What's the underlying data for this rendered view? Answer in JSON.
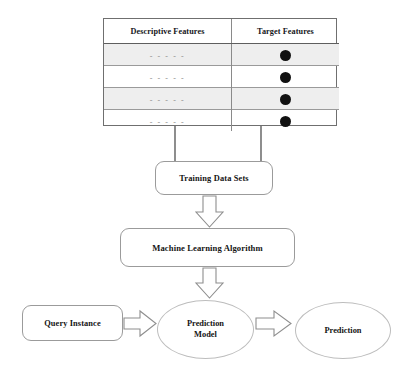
{
  "diagram": {
    "background_color": "#ffffff",
    "line_color": "#9b9b9b",
    "text_color": "#141414",
    "dot_color": "#111111",
    "shaded_row_color": "#eeeeee"
  },
  "table": {
    "name": "training-data-table",
    "columns": [
      {
        "key": "descriptive",
        "header": "Descriptive Features"
      },
      {
        "key": "target",
        "header": "Target Features"
      }
    ],
    "rows": [
      {
        "descriptive": "- - - - -",
        "target": "filled-circle",
        "shaded": true
      },
      {
        "descriptive": "- - - - -",
        "target": "filled-circle",
        "shaded": false
      },
      {
        "descriptive": "- - - - -",
        "target": "filled-circle",
        "shaded": true
      },
      {
        "descriptive": "- - - - -",
        "target": "filled-circle",
        "shaded": false
      }
    ]
  },
  "nodes": {
    "training_data_sets": {
      "label": "Training Data Sets",
      "shape": "rounded-rect"
    },
    "machine_learning_algorithm": {
      "label": "Machine Learning Algorithm",
      "shape": "rounded-rect"
    },
    "query_instance": {
      "label": "Query Instance",
      "shape": "rounded-rect"
    },
    "prediction_model": {
      "label_line1": "Prediction",
      "label_line2": "Model",
      "shape": "ellipse"
    },
    "prediction": {
      "label": "Prediction",
      "shape": "ellipse"
    }
  },
  "connectors": [
    {
      "name": "table-to-training-left",
      "style": "plain-line",
      "direction": "down"
    },
    {
      "name": "table-to-training-right",
      "style": "plain-line",
      "direction": "down"
    },
    {
      "name": "training-to-algorithm",
      "style": "hollow-block-arrow",
      "direction": "down"
    },
    {
      "name": "algorithm-to-prediction-model",
      "style": "hollow-block-arrow",
      "direction": "down"
    },
    {
      "name": "query-to-prediction-model",
      "style": "hollow-block-arrow",
      "direction": "right"
    },
    {
      "name": "prediction-model-to-prediction",
      "style": "hollow-block-arrow",
      "direction": "right"
    }
  ]
}
